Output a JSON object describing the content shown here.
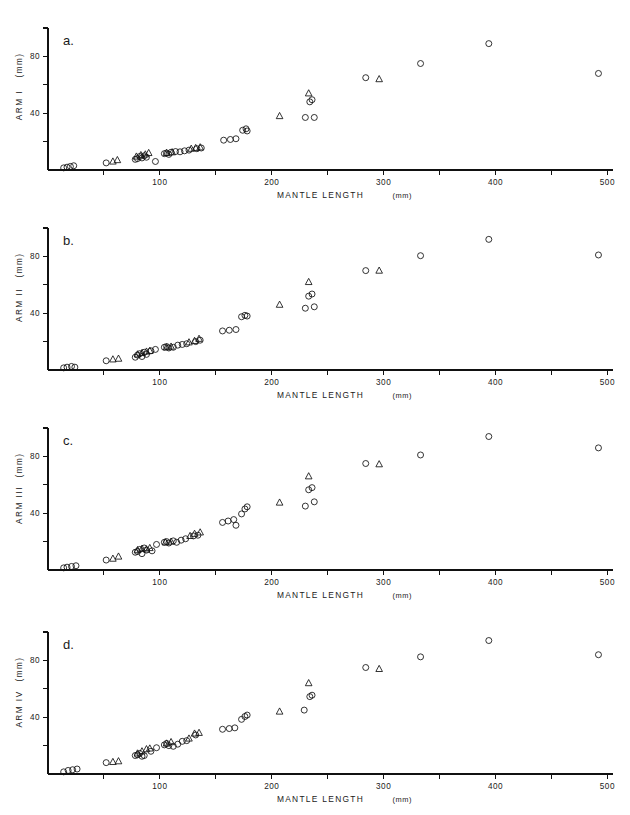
{
  "figure": {
    "background": "#ffffff",
    "ink_color": "#111111",
    "width": 630,
    "height": 815
  },
  "chart_data": [
    {
      "type": "scatter",
      "panel_label": "a.",
      "title": "",
      "xlabel": "MANTLE  LENGTH",
      "xlabel_unit": "(mm)",
      "ylabel": "ARM  I",
      "ylabel_unit": "(mm)",
      "xlim": [
        0,
        505
      ],
      "ylim": [
        0,
        100
      ],
      "xticks": [
        50,
        100,
        150,
        200,
        250,
        300,
        350,
        400,
        450,
        500
      ],
      "xtick_labels": [
        "",
        "100",
        "",
        "200",
        "",
        "300",
        "",
        "400",
        "",
        "500"
      ],
      "yticks": [
        20,
        40,
        60,
        80,
        100
      ],
      "ytick_labels": [
        "",
        "40",
        "",
        "80",
        ""
      ],
      "grid": false,
      "legend": "none",
      "series": [
        {
          "name": "circles",
          "marker": "circle",
          "points": [
            [
              14,
              1.5
            ],
            [
              17,
              2.0
            ],
            [
              20,
              2.5
            ],
            [
              23,
              3.0
            ],
            [
              52,
              5.0
            ],
            [
              78,
              7.5
            ],
            [
              80,
              8.0
            ],
            [
              82,
              9.5
            ],
            [
              84,
              8.5
            ],
            [
              86,
              10.0
            ],
            [
              88,
              9.0
            ],
            [
              96,
              6.0
            ],
            [
              104,
              11.5
            ],
            [
              106,
              12.0
            ],
            [
              108,
              11.0
            ],
            [
              110,
              12.5
            ],
            [
              114,
              13.0
            ],
            [
              118,
              12.8
            ],
            [
              122,
              13.5
            ],
            [
              126,
              14.0
            ],
            [
              133,
              15.0
            ],
            [
              137,
              15.5
            ],
            [
              157,
              21.0
            ],
            [
              163,
              21.5
            ],
            [
              168,
              22.0
            ],
            [
              174,
              28.0
            ],
            [
              177,
              29.0
            ],
            [
              178,
              27.5
            ],
            [
              230,
              37.0
            ],
            [
              238,
              37.0
            ],
            [
              234,
              48.0
            ],
            [
              236,
              49.5
            ],
            [
              284,
              65.0
            ],
            [
              333,
              75.0
            ],
            [
              394,
              89.0
            ],
            [
              492,
              68.0
            ]
          ]
        },
        {
          "name": "triangles",
          "marker": "triangle",
          "points": [
            [
              58,
              6.0
            ],
            [
              62,
              7.0
            ],
            [
              79,
              9.5
            ],
            [
              83,
              10.5
            ],
            [
              87,
              11.0
            ],
            [
              90,
              12.0
            ],
            [
              106,
              12.0
            ],
            [
              111,
              12.5
            ],
            [
              128,
              15.0
            ],
            [
              132,
              15.5
            ],
            [
              136,
              16.0
            ],
            [
              207,
              38.0
            ],
            [
              233,
              54.0
            ],
            [
              296,
              64.0
            ]
          ]
        }
      ]
    },
    {
      "type": "scatter",
      "panel_label": "b.",
      "title": "",
      "xlabel": "MANTLE  LENGTH",
      "xlabel_unit": "(mm)",
      "ylabel": "ARM  II",
      "ylabel_unit": "(mm)",
      "xlim": [
        0,
        505
      ],
      "ylim": [
        0,
        100
      ],
      "xticks": [
        50,
        100,
        150,
        200,
        250,
        300,
        350,
        400,
        450,
        500
      ],
      "xtick_labels": [
        "",
        "100",
        "",
        "200",
        "",
        "300",
        "",
        "400",
        "",
        "500"
      ],
      "yticks": [
        20,
        40,
        60,
        80,
        100
      ],
      "ytick_labels": [
        "",
        "40",
        "",
        "80",
        ""
      ],
      "grid": false,
      "legend": "none",
      "series": [
        {
          "name": "circles",
          "marker": "circle",
          "points": [
            [
              14,
              1.5
            ],
            [
              17,
              2.0
            ],
            [
              21,
              2.5
            ],
            [
              24,
              2.0
            ],
            [
              52,
              6.5
            ],
            [
              78,
              9.0
            ],
            [
              80,
              10.5
            ],
            [
              82,
              11.5
            ],
            [
              84,
              9.5
            ],
            [
              86,
              12.5
            ],
            [
              88,
              11.0
            ],
            [
              92,
              13.5
            ],
            [
              96,
              14.5
            ],
            [
              104,
              16.0
            ],
            [
              106,
              16.5
            ],
            [
              108,
              15.5
            ],
            [
              112,
              16.0
            ],
            [
              116,
              17.5
            ],
            [
              120,
              18.0
            ],
            [
              124,
              18.5
            ],
            [
              132,
              20.0
            ],
            [
              136,
              21.0
            ],
            [
              156,
              27.5
            ],
            [
              162,
              28.0
            ],
            [
              168,
              28.5
            ],
            [
              173,
              37.5
            ],
            [
              176,
              38.5
            ],
            [
              178,
              38.0
            ],
            [
              230,
              43.5
            ],
            [
              238,
              44.5
            ],
            [
              233,
              52.0
            ],
            [
              236,
              53.5
            ],
            [
              284,
              70.0
            ],
            [
              333,
              80.5
            ],
            [
              394,
              92.0
            ],
            [
              492,
              81.0
            ]
          ]
        },
        {
          "name": "triangles",
          "marker": "triangle",
          "points": [
            [
              58,
              7.5
            ],
            [
              63,
              8.0
            ],
            [
              80,
              11.0
            ],
            [
              84,
              12.0
            ],
            [
              88,
              13.0
            ],
            [
              91,
              13.5
            ],
            [
              106,
              16.0
            ],
            [
              110,
              16.5
            ],
            [
              126,
              19.5
            ],
            [
              131,
              20.5
            ],
            [
              135,
              22.0
            ],
            [
              207,
              46.0
            ],
            [
              233,
              62.0
            ],
            [
              296,
              70.0
            ]
          ]
        }
      ]
    },
    {
      "type": "scatter",
      "panel_label": "c.",
      "title": "",
      "xlabel": "MANTLE  LENGTH",
      "xlabel_unit": "(mm)",
      "ylabel": "ARM  III",
      "ylabel_unit": "(mm)",
      "xlim": [
        0,
        505
      ],
      "ylim": [
        0,
        100
      ],
      "xticks": [
        50,
        100,
        150,
        200,
        250,
        300,
        350,
        400,
        450,
        500
      ],
      "xtick_labels": [
        "",
        "100",
        "",
        "200",
        "",
        "300",
        "",
        "400",
        "",
        "500"
      ],
      "yticks": [
        20,
        40,
        60,
        80,
        100
      ],
      "ytick_labels": [
        "",
        "40",
        "",
        "80",
        ""
      ],
      "grid": false,
      "legend": "none",
      "series": [
        {
          "name": "circles",
          "marker": "circle",
          "points": [
            [
              14,
              1.5
            ],
            [
              17,
              2.0
            ],
            [
              21,
              2.5
            ],
            [
              25,
              3.0
            ],
            [
              52,
              7.0
            ],
            [
              78,
              12.5
            ],
            [
              80,
              13.0
            ],
            [
              82,
              14.5
            ],
            [
              84,
              11.5
            ],
            [
              86,
              15.5
            ],
            [
              88,
              14.0
            ],
            [
              93,
              13.5
            ],
            [
              97,
              18.0
            ],
            [
              104,
              19.5
            ],
            [
              106,
              20.0
            ],
            [
              108,
              19.0
            ],
            [
              112,
              20.5
            ],
            [
              115,
              19.5
            ],
            [
              119,
              21.0
            ],
            [
              123,
              22.0
            ],
            [
              130,
              24.0
            ],
            [
              134,
              24.5
            ],
            [
              156,
              33.5
            ],
            [
              161,
              34.5
            ],
            [
              166,
              35.5
            ],
            [
              168,
              31.5
            ],
            [
              173,
              39.5
            ],
            [
              176,
              43.0
            ],
            [
              178,
              44.5
            ],
            [
              230,
              45.0
            ],
            [
              238,
              48.0
            ],
            [
              233,
              56.5
            ],
            [
              236,
              58.0
            ],
            [
              284,
              75.0
            ],
            [
              333,
              81.0
            ],
            [
              394,
              94.0
            ],
            [
              492,
              86.0
            ]
          ]
        },
        {
          "name": "triangles",
          "marker": "triangle",
          "points": [
            [
              58,
              8.0
            ],
            [
              63,
              9.5
            ],
            [
              80,
              14.0
            ],
            [
              84,
              15.0
            ],
            [
              88,
              14.5
            ],
            [
              91,
              15.5
            ],
            [
              105,
              19.5
            ],
            [
              110,
              20.0
            ],
            [
              127,
              24.0
            ],
            [
              131,
              25.5
            ],
            [
              136,
              26.5
            ],
            [
              207,
              47.5
            ],
            [
              233,
              66.0
            ],
            [
              296,
              74.5
            ]
          ]
        }
      ]
    },
    {
      "type": "scatter",
      "panel_label": "d.",
      "title": "",
      "xlabel": "MANTLE  LENGTH",
      "xlabel_unit": "(mm)",
      "ylabel": "ARM  IV",
      "ylabel_unit": "(mm)",
      "xlim": [
        0,
        505
      ],
      "ylim": [
        0,
        100
      ],
      "xticks": [
        50,
        100,
        150,
        200,
        250,
        300,
        350,
        400,
        450,
        500
      ],
      "xtick_labels": [
        "",
        "100",
        "",
        "200",
        "",
        "300",
        "",
        "400",
        "",
        "500"
      ],
      "yticks": [
        20,
        40,
        60,
        80,
        100
      ],
      "ytick_labels": [
        "",
        "40",
        "",
        "80",
        ""
      ],
      "grid": false,
      "legend": "none",
      "series": [
        {
          "name": "circles",
          "marker": "circle",
          "points": [
            [
              14,
              1.5
            ],
            [
              18,
              2.5
            ],
            [
              22,
              3.0
            ],
            [
              26,
              3.5
            ],
            [
              52,
              8.0
            ],
            [
              78,
              13.0
            ],
            [
              80,
              13.5
            ],
            [
              82,
              14.5
            ],
            [
              84,
              12.5
            ],
            [
              86,
              13.0
            ],
            [
              92,
              16.0
            ],
            [
              97,
              18.5
            ],
            [
              104,
              20.5
            ],
            [
              106,
              21.5
            ],
            [
              108,
              20.0
            ],
            [
              112,
              19.5
            ],
            [
              116,
              21.0
            ],
            [
              120,
              23.0
            ],
            [
              124,
              23.5
            ],
            [
              132,
              27.5
            ],
            [
              156,
              31.5
            ],
            [
              162,
              32.0
            ],
            [
              167,
              32.5
            ],
            [
              173,
              38.5
            ],
            [
              176,
              40.5
            ],
            [
              178,
              41.5
            ],
            [
              229,
              45.0
            ],
            [
              234,
              54.5
            ],
            [
              236,
              55.5
            ],
            [
              284,
              75.0
            ],
            [
              333,
              82.5
            ],
            [
              394,
              94.0
            ],
            [
              492,
              84.0
            ]
          ]
        },
        {
          "name": "triangles",
          "marker": "triangle",
          "points": [
            [
              58,
              8.5
            ],
            [
              63,
              9.0
            ],
            [
              80,
              14.5
            ],
            [
              84,
              16.0
            ],
            [
              88,
              17.5
            ],
            [
              91,
              18.0
            ],
            [
              106,
              21.5
            ],
            [
              110,
              22.5
            ],
            [
              126,
              25.0
            ],
            [
              131,
              28.5
            ],
            [
              135,
              29.0
            ],
            [
              207,
              44.0
            ],
            [
              233,
              64.0
            ],
            [
              296,
              74.0
            ]
          ]
        }
      ]
    }
  ]
}
